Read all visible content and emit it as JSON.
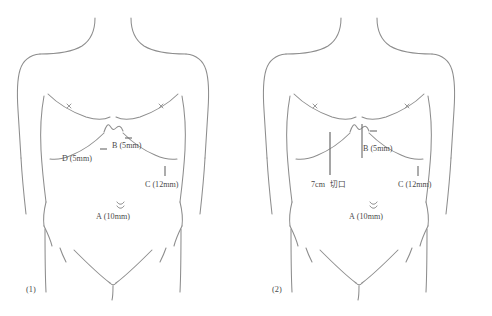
{
  "diagram": {
    "type": "anatomical-port-placement",
    "line_color": "#8d8d8d",
    "marker_color": "#6f6f6f",
    "text_color": "#4a4a4a",
    "background": "#ffffff",
    "figures": [
      {
        "id": "figure-1",
        "caption": "(1)",
        "caption_x": 26,
        "caption_y": 292,
        "ports": [
          {
            "key": "B",
            "label": "B (5mm)",
            "marker": "horizontal-dash",
            "label_x": 112,
            "label_y": 148,
            "tick_x1": 125,
            "tick_y1": 138,
            "tick_x2": 132,
            "tick_y2": 138
          },
          {
            "key": "D",
            "label": "D (5mm)",
            "marker": "horizontal-dash",
            "label_x": 62,
            "label_y": 161,
            "tick_x1": 100,
            "tick_y1": 149,
            "tick_x2": 107,
            "tick_y2": 149
          },
          {
            "key": "C",
            "label": "C (12mm)",
            "marker": "vertical-line",
            "label_x": 145,
            "label_y": 187,
            "tick_x1": 165,
            "tick_y1": 166,
            "tick_x2": 165,
            "tick_y2": 176
          },
          {
            "key": "A",
            "label": "A (10mm)",
            "marker": "umbilicus",
            "label_x": 96,
            "label_y": 219,
            "tick_x1": 117,
            "tick_y1": 204,
            "tick_x2": 124,
            "tick_y2": 204
          }
        ],
        "incision": null
      },
      {
        "id": "figure-2",
        "caption": "(2)",
        "caption_x": 272,
        "caption_y": 292,
        "ports": [
          {
            "key": "B",
            "label": "B (5mm)",
            "marker": "vertical-line-and-dash",
            "label_x": 371,
            "label_y": 151,
            "tick_x1": 370,
            "tick_y1": 131,
            "tick_x2": 377,
            "tick_y2": 131
          },
          {
            "key": "C",
            "label": "C (12mm)",
            "marker": "vertical-line",
            "label_x": 398,
            "label_y": 187,
            "tick_x1": 418,
            "tick_y1": 166,
            "tick_x2": 418,
            "tick_y2": 176
          },
          {
            "key": "A",
            "label": "A (10mm)",
            "marker": "umbilicus",
            "label_x": 349,
            "label_y": 219,
            "tick_x1": 370,
            "tick_y1": 204,
            "tick_x2": 377,
            "tick_y2": 204
          }
        ],
        "incision": {
          "length_label": "7cm",
          "kind_label": "切口",
          "label_x": 311,
          "label_y": 187,
          "line_x": 330,
          "line_y1": 132,
          "line_y2": 175
        }
      }
    ]
  }
}
